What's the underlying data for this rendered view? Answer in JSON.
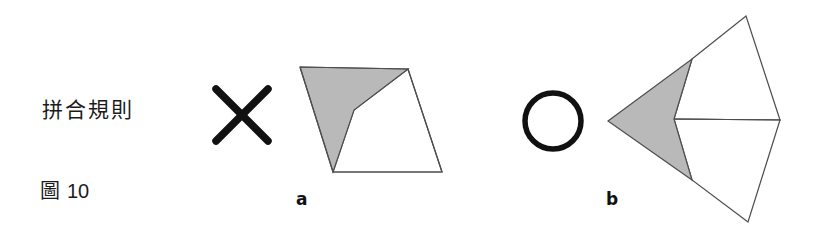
{
  "figure": {
    "caption_cjk": "拼合規則",
    "figure_label_cjk": "圖",
    "figure_number": "10",
    "panels": [
      {
        "id": "a",
        "label": "a"
      },
      {
        "id": "b",
        "label": "b"
      }
    ],
    "operators": [
      {
        "id": "cross",
        "name": "x-mark-operator",
        "glyph": "X"
      },
      {
        "id": "circle",
        "name": "circle-operator",
        "glyph": "O"
      }
    ],
    "colors": {
      "gray_fill": "#b9b9b9",
      "outline": "#4d4d4d",
      "ink": "#111111",
      "background": "#ffffff",
      "text": "#1b1b1b"
    },
    "geometry": {
      "panel_a": {
        "description": "quadrilateral folded into gray and white faces",
        "gray_face_points": "300,67 408,69 354,110 333,172",
        "white_face_points": "408,69 442,172 333,172 354,110",
        "outline_points": "300,67 408,69 442,172 333,172"
      },
      "panel_b": {
        "description": "kite folded into one gray face and two white faces",
        "gray_face_points": "608,121 692,59 674,119 692,180",
        "white_face_upper_points": "692,59 746,16 780,120 674,119",
        "white_face_lower_points": "674,119 780,120 748,222 692,180",
        "fold_line": "674,119 780,120"
      },
      "cross_mark": {
        "line1": "216,89 268,141",
        "line2": "268,89 216,141"
      },
      "circle_mark": {
        "cx": 553,
        "cy": 121,
        "r": 28
      }
    }
  }
}
